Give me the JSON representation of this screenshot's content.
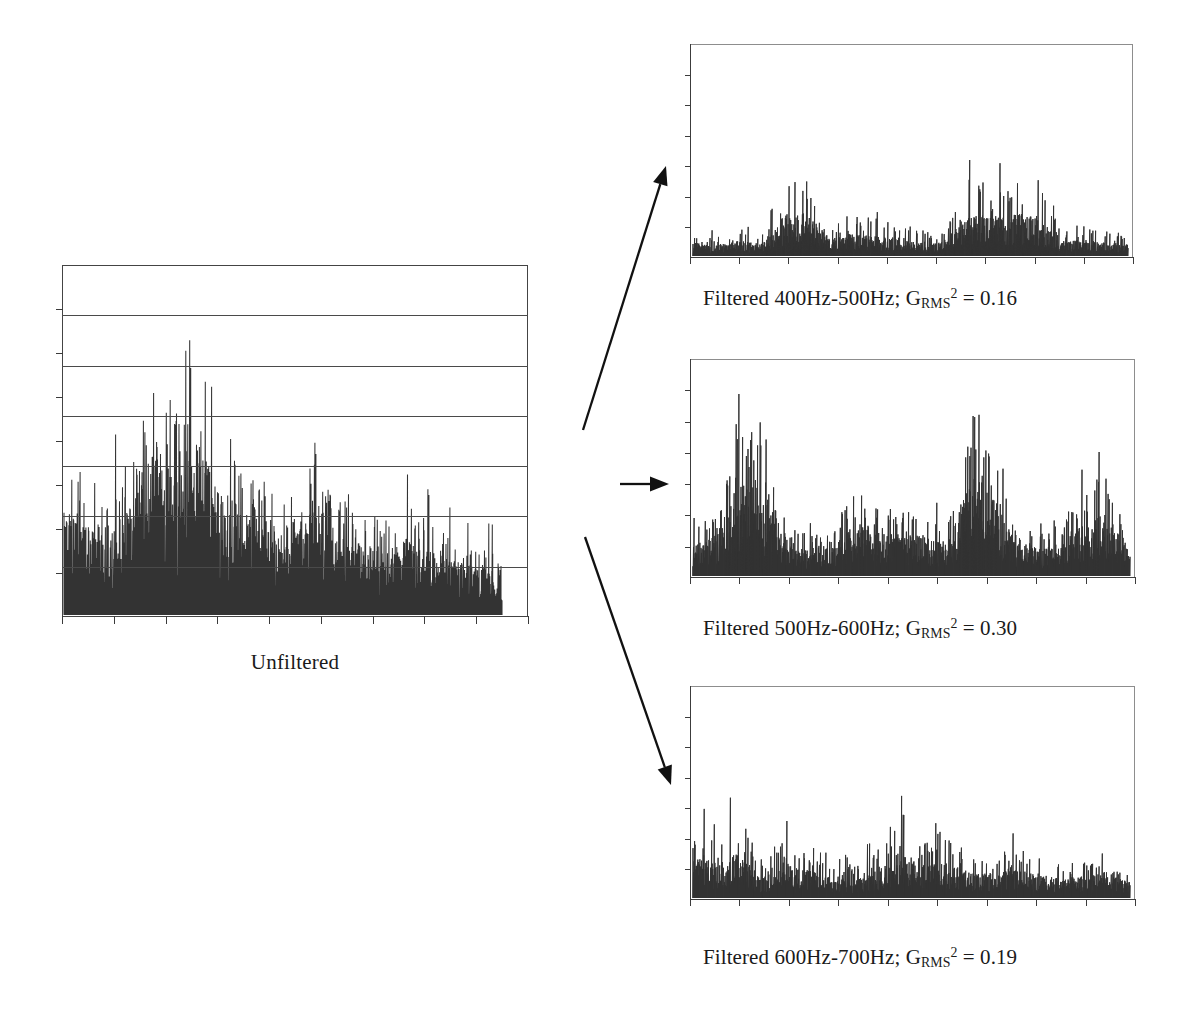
{
  "figure": {
    "background_color": "#ffffff",
    "ink_color": "#1a1a1a",
    "trace_color": "#333333",
    "grid_color": "#4a4a4a",
    "subframe_color": "#8d8d8d"
  },
  "unfiltered": {
    "caption": "Unfiltered"
  },
  "panels": [
    {
      "id": "filtered-400-500",
      "caption_prefix": "Filtered 400Hz-500Hz; G",
      "caption_sub": "RMS",
      "caption_sup": "2",
      "caption_suffix": " = 0.16",
      "band_low_hz": 400,
      "band_high_hz": 500,
      "grms2": 0.16
    },
    {
      "id": "filtered-500-600",
      "caption_prefix": "Filtered 500Hz-600Hz; G",
      "caption_sub": "RMS",
      "caption_sup": "2",
      "caption_suffix": " = 0.30",
      "band_low_hz": 500,
      "band_high_hz": 600,
      "grms2": 0.3
    },
    {
      "id": "filtered-600-700",
      "caption_prefix": "Filtered 600Hz-700Hz; G",
      "caption_sub": "RMS",
      "caption_sup": "2",
      "caption_suffix": " = 0.19",
      "band_low_hz": 600,
      "band_high_hz": 700,
      "grms2": 0.19
    }
  ],
  "arrows": [
    {
      "name": "arrow-to-400-500",
      "from": [
        583,
        430
      ],
      "to": [
        666,
        166
      ]
    },
    {
      "name": "arrow-to-500-600",
      "from": [
        620,
        484
      ],
      "to": [
        669,
        484
      ]
    },
    {
      "name": "arrow-to-600-700",
      "from": [
        585,
        537
      ],
      "to": [
        671,
        785
      ]
    }
  ],
  "chart_data": {
    "type": "line",
    "xlabel": "",
    "ylabel": "",
    "grid": "horizontal-only-on-unfiltered",
    "legend": "none",
    "charts": [
      {
        "name": "Unfiltered",
        "caption": "Unfiltered",
        "type": "line",
        "grid_lines_y": 6,
        "x_ticks": 9,
        "y_ticks": 8,
        "ylim": [
          0,
          1
        ],
        "xlim": [
          0,
          1
        ],
        "data_extent_fraction_of_axis": 0.945,
        "description": "Dense rectified acceleration noise floor with a decaying envelope; largest spikes reach near the top of the frame early in the record and fall off toward the right.",
        "envelope_profile": [
          0.62,
          0.55,
          0.5,
          0.62,
          0.97,
          0.78,
          0.88,
          0.7,
          0.55,
          0.52,
          0.48,
          0.62,
          0.45,
          0.4,
          0.38,
          0.44,
          0.35,
          0.3,
          0.28,
          0.26
        ],
        "noise_floor_fraction": 0.3
      },
      {
        "name": "Filtered 400Hz-500Hz",
        "caption_text": "Filtered 400Hz-500Hz; GRMS^2 = 0.16",
        "type": "line",
        "grms2": 0.16,
        "grid_lines_y": 0,
        "y_ticks": 7,
        "x_ticks": 9,
        "ylim": [
          0,
          1
        ],
        "description": "Sparse rectified burst train, peak amplitudes around 0.55 of the frame height, clustered around the middle and right-of-centre of the record.",
        "envelope_profile": [
          0.16,
          0.14,
          0.18,
          0.15,
          0.5,
          0.52,
          0.22,
          0.28,
          0.24,
          0.2,
          0.18,
          0.16,
          0.52,
          0.48,
          0.5,
          0.52,
          0.18,
          0.2,
          0.16,
          0.14
        ],
        "noise_floor_fraction": 0.1
      },
      {
        "name": "Filtered 500Hz-600Hz",
        "caption_text": "Filtered 500Hz-600Hz; GRMS^2 = 0.30",
        "type": "line",
        "grms2": 0.3,
        "grid_lines_y": 0,
        "y_ticks": 7,
        "x_ticks": 9,
        "ylim": [
          0,
          1
        ],
        "description": "Highest-energy band: tall isolated spikes reaching ~0.90 of frame height, densest noise floor of the three filtered traces.",
        "envelope_profile": [
          0.3,
          0.4,
          0.9,
          0.82,
          0.3,
          0.28,
          0.26,
          0.55,
          0.48,
          0.4,
          0.42,
          0.3,
          0.88,
          0.8,
          0.32,
          0.28,
          0.3,
          0.55,
          0.62,
          0.25
        ],
        "noise_floor_fraction": 0.18
      },
      {
        "name": "Filtered 600Hz-700Hz",
        "caption_text": "Filtered 600Hz-700Hz; GRMS^2 = 0.19",
        "type": "line",
        "grms2": 0.19,
        "grid_lines_y": 0,
        "y_ticks": 7,
        "x_ticks": 9,
        "ylim": [
          0,
          1
        ],
        "description": "Moderate burst train decaying from left to right; tallest spikes ~0.56 near the start and ~0.52 near the middle.",
        "envelope_profile": [
          0.48,
          0.4,
          0.56,
          0.22,
          0.42,
          0.34,
          0.28,
          0.2,
          0.3,
          0.52,
          0.36,
          0.4,
          0.3,
          0.26,
          0.32,
          0.28,
          0.22,
          0.26,
          0.3,
          0.18
        ],
        "noise_floor_fraction": 0.12
      }
    ]
  }
}
